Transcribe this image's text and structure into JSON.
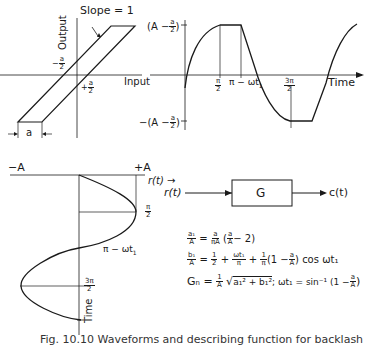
{
  "figure": {
    "caption": "Fig. 10.10 Waveforms and describing function for backlash"
  },
  "backlash_plot": {
    "slope_label": "Slope = 1",
    "y_axis_label": "Output",
    "x_axis_label": "Input",
    "neg_half_a": "a",
    "pos_half_a": "a",
    "width_label": "a"
  },
  "output_waveform": {
    "top_level": {
      "open": "(A −",
      "num": "a",
      "den": "2",
      "close": ")"
    },
    "bottom_level": {
      "open": "−(A −",
      "num": "a",
      "den": "2",
      "close": ")"
    },
    "ticks": {
      "pi_over_2": {
        "num": "π",
        "den": "2"
      },
      "pi_minus_wt1": "π − ωt",
      "sub1": "1",
      "three_pi_over_2": {
        "num": "3π",
        "den": "2"
      }
    },
    "x_axis_label": "Time"
  },
  "input_waveform": {
    "neg_A": "−A",
    "pos_A": "+A",
    "axis_label": "r(t)",
    "arrow": "→",
    "pi_over_2": {
      "num": "π",
      "den": "2"
    },
    "pi_minus_wt1": "π − ωt",
    "sub1": "1",
    "three_pi_over_2": {
      "num": "3π",
      "den": "2"
    },
    "time_label": "Time"
  },
  "block_diagram": {
    "input": "r(t)",
    "block": "G",
    "output": "c(t)"
  },
  "equations": {
    "eq1": {
      "lhs_num": "a₁",
      "lhs_den": "A",
      "eq": "=",
      "f1_num": "a",
      "f1_den": "πA",
      "open": "(",
      "f2_num": "a",
      "f2_den": "A",
      "rest": "− 2)"
    },
    "eq2": {
      "lhs_num": "b₁",
      "lhs_den": "A",
      "eq": "=",
      "f1_num": "1",
      "f1_den": "2",
      "plus1": "+",
      "f2_num": "ωt₁",
      "f2_den": "π",
      "plus2": "+",
      "f3_num": "1",
      "f3_den": "π",
      "open": "(1 −",
      "f4_num": "a",
      "f4_den": "A",
      "close": ")",
      "tail": "cos ωt₁"
    },
    "eq3": {
      "lhs": "Gₙ",
      "eq": "=",
      "f1_num": "1",
      "f1_den": "A",
      "sqrt": "√",
      "radicand": "a₁² + b₁²",
      "sep": ";  ωt₁ = sin⁻¹ (1 −",
      "f2_num": "a",
      "f2_den": "A",
      "close": ")"
    }
  }
}
